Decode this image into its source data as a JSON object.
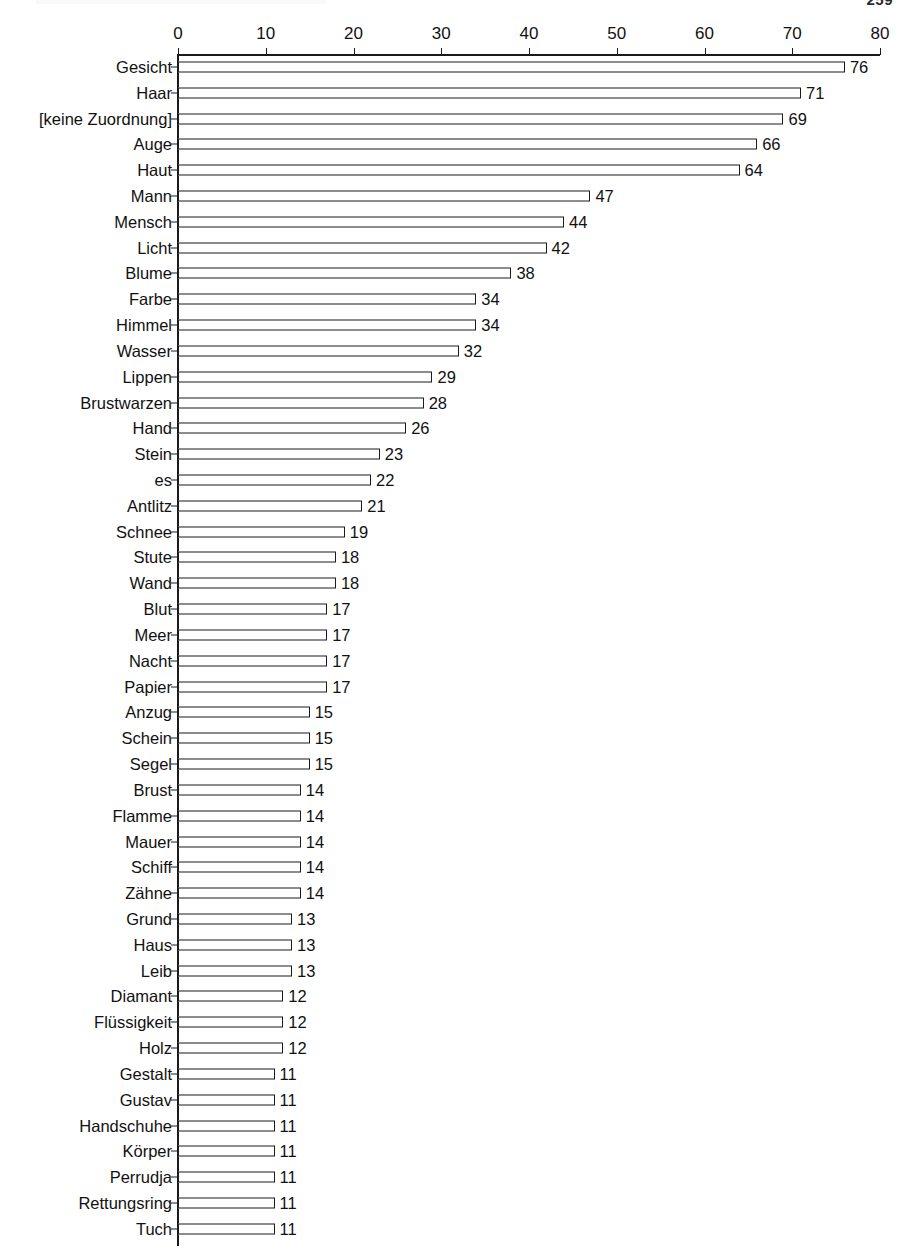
{
  "page": {
    "number": "259"
  },
  "chart_data": {
    "type": "bar",
    "orientation": "horizontal",
    "title": "",
    "subtitle": "",
    "xlabel": "",
    "ylabel": "",
    "xlim": [
      0,
      80
    ],
    "xticks": [
      0,
      10,
      20,
      30,
      40,
      50,
      60,
      70,
      80
    ],
    "xtick_labels": [
      "0",
      "10",
      "20",
      "30",
      "40",
      "50",
      "60",
      "70",
      "80"
    ],
    "grid": false,
    "legend": false,
    "bar_style": {
      "fill": "#ffffff",
      "edge": "#1a1a1a"
    },
    "show_value_labels": true,
    "categories": [
      "Gesicht",
      "Haar",
      "[keine Zuordnung]",
      "Auge",
      "Haut",
      "Mann",
      "Mensch",
      "Licht",
      "Blume",
      "Farbe",
      "Himmel",
      "Wasser",
      "Lippen",
      "Brustwarzen",
      "Hand",
      "Stein",
      "es",
      "Antlitz",
      "Schnee",
      "Stute",
      "Wand",
      "Blut",
      "Meer",
      "Nacht",
      "Papier",
      "Anzug",
      "Schein",
      "Segel",
      "Brust",
      "Flamme",
      "Mauer",
      "Schiff",
      "Zähne",
      "Grund",
      "Haus",
      "Leib",
      "Diamant",
      "Flüssigkeit",
      "Holz",
      "Gestalt",
      "Gustav",
      "Handschuhe",
      "Körper",
      "Perrudja",
      "Rettungsring",
      "Tuch"
    ],
    "values": [
      76,
      71,
      69,
      66,
      64,
      47,
      44,
      42,
      38,
      34,
      34,
      32,
      29,
      28,
      26,
      23,
      22,
      21,
      19,
      18,
      18,
      17,
      17,
      17,
      17,
      15,
      15,
      15,
      14,
      14,
      14,
      14,
      14,
      13,
      13,
      13,
      12,
      12,
      12,
      11,
      11,
      11,
      11,
      11,
      11,
      11
    ],
    "value_labels": [
      "76",
      "71",
      "69",
      "66",
      "64",
      "47",
      "44",
      "42",
      "38",
      "34",
      "34",
      "32",
      "29",
      "28",
      "26",
      "23",
      "22",
      "21",
      "19",
      "18",
      "18",
      "17",
      "17",
      "17",
      "17",
      "15",
      "15",
      "15",
      "14",
      "14",
      "14",
      "14",
      "14",
      "13",
      "13",
      "13",
      "12",
      "12",
      "12",
      "11",
      "11",
      "11",
      "11",
      "11",
      "11",
      "11"
    ]
  }
}
